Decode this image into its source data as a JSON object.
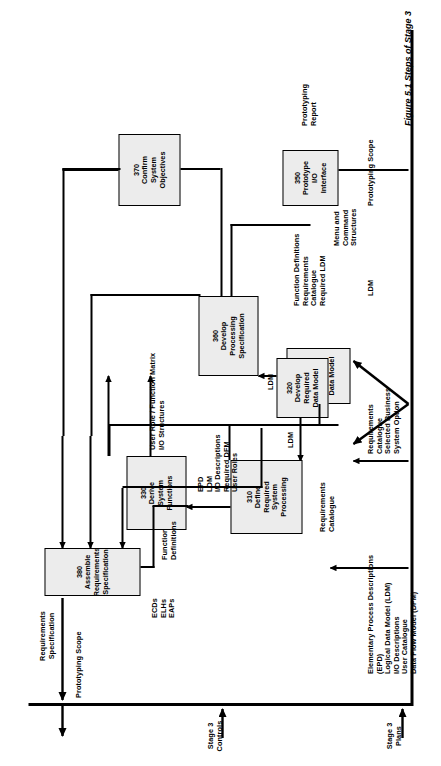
{
  "figure": {
    "caption": "Figure 5.1  Steps of Stage 3"
  },
  "inputs": {
    "stage3_plans": "Stage 3\nPlans",
    "stage3_controls": "Stage 3\nControls",
    "prototyping_scope_top": "Prototyping Scope",
    "prototyping_scope_bottom": "Prototyping Scope",
    "products_list": "Elementary Process Descriptions\n(EPD)\nLogical Data Model (LDM)\nI/O Descriptions\nUser Catalogue\nData Flow Model (DFM)",
    "requirements_business": "Requirements\nCatalogue\nSelected Business\nSystem Option",
    "ldm_bottom": "LDM"
  },
  "outputs": {
    "requirements_specification": "Requirements\nSpecification",
    "prototyping_report": "Prototyping\nReport"
  },
  "steps": [
    {
      "id": "310",
      "number": "310",
      "title": "Define\nRequired\nSystem\nProcessing",
      "label": "310\nDefine\nRequired\nSystem\nProcessing"
    },
    {
      "id": "320",
      "number": "320",
      "title": "Develop\nRequired\nData Model",
      "label": "320\nDevelop\nRequired\nData Model"
    },
    {
      "id": "330",
      "number": "330",
      "title": "Derive\nSystem\nFunctions",
      "label": "330\nDerive\nSystem\nFunctions"
    },
    {
      "id": "340",
      "number": "340",
      "title": "Enhance\nRequired\nData Model",
      "label": "340\nEnhance\nRequired\nData Model"
    },
    {
      "id": "350",
      "number": "350",
      "title": "Prototype\nI/O\nInterface",
      "label": "350\nPrototype\nI/O\nInterface"
    },
    {
      "id": "360",
      "number": "360",
      "title": "Develop\nProcessing\nSpecification",
      "label": "360\nDevelop\nProcessing\nSpecification"
    },
    {
      "id": "370",
      "number": "370",
      "title": "Confirm\nSystem\nObjectives",
      "label": "370\nConfirm\nSystem\nObjectives"
    },
    {
      "id": "380",
      "number": "380",
      "title": "Assemble\nRequirements\nSpecification",
      "label": "380\nAssemble\nRequirements\nSpecification"
    }
  ],
  "flows": {
    "epd_group": "EPD\nLDM\nI/O Descriptions\nRequired DFM\nUser Roles",
    "requirements_catalogue": "Requirements\nCatalogue",
    "ldm_320_to_310": "LDM",
    "user_role_matrix": "User Role / Function Matrix\nI/O Structures",
    "function_definitions": "Function\nDefinitions",
    "ldm_340_to_360": "LDM",
    "func_def_group": "Function Definitions\nRequirements\nCatalogue\nRequired LDM",
    "menu_command": "Menu and\nCommand\nStructures",
    "ecds_group": "ECDs\nELHs\nEAPs"
  }
}
